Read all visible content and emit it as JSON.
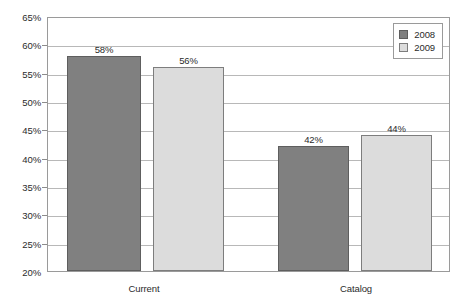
{
  "chart_data": {
    "type": "bar",
    "title": "",
    "xlabel": "",
    "ylabel": "",
    "categories": [
      "Current",
      "Catalog"
    ],
    "series": [
      {
        "name": "2008",
        "values": [
          58,
          56
        ],
        "color": "#808080"
      },
      {
        "name": "2009",
        "values": [
          56,
          44
        ],
        "color": "#dcdcdc"
      }
    ],
    "series_fixed": [
      {
        "name": "2008",
        "values": [
          58,
          42
        ],
        "color": "#808080"
      },
      {
        "name": "2009",
        "values": [
          56,
          44
        ],
        "color": "#dcdcdc"
      }
    ],
    "value_labels": [
      [
        "58%",
        "56%"
      ],
      [
        "42%",
        "44%"
      ]
    ],
    "ylim": [
      20,
      65
    ],
    "ytick_step": 5,
    "ytick_labels": [
      "65%",
      "60%",
      "55%",
      "50%",
      "45%",
      "40%",
      "35%",
      "30%",
      "25%",
      "20%"
    ],
    "ytick_values": [
      65,
      60,
      55,
      50,
      45,
      40,
      35,
      30,
      25,
      20
    ],
    "grid": true,
    "legend_position": "top-right",
    "unit": "%"
  },
  "legend": {
    "entries": [
      {
        "label": "2008"
      },
      {
        "label": "2009"
      }
    ]
  },
  "colors": {
    "series_2008": "#808080",
    "series_2009": "#dcdcdc",
    "gridline": "#b8b8b8",
    "frame": "#9a9a9a",
    "text": "#2b2b2b",
    "background": "#ffffff"
  }
}
